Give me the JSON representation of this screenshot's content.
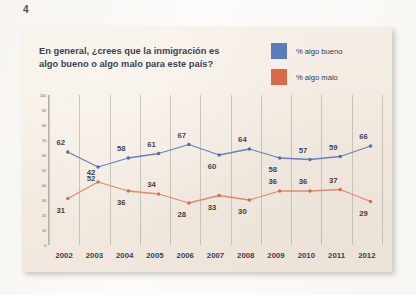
{
  "page": {
    "number": "4"
  },
  "chart_card": {
    "title_line_1": "En general, ¿crees que la inmigración es",
    "title_line_2": "algo bueno o algo malo para este país?"
  },
  "legend": {
    "items": [
      {
        "label": "% algo bueno",
        "color": "#5b7cba",
        "swatch_name": "legend-swatch-algo-bueno"
      },
      {
        "label": "% algo malo",
        "color": "#d96a47",
        "swatch_name": "legend-swatch-algo-malo"
      }
    ]
  },
  "chart_data": {
    "type": "line",
    "title": "En general, ¿crees que la inmigración es algo bueno o algo malo para este país?",
    "xlabel": "",
    "ylabel": "",
    "ylim": [
      0,
      100
    ],
    "ytick_labels": [
      "100",
      "90",
      "80",
      "70",
      "60",
      "50",
      "40",
      "30",
      "20",
      "10",
      "0"
    ],
    "ytick_values": [
      100,
      90,
      80,
      70,
      60,
      50,
      40,
      30,
      20,
      10,
      0
    ],
    "categories": [
      "2002",
      "2003",
      "2004",
      "2005",
      "2006",
      "2007",
      "2008",
      "2009",
      "2010",
      "2011",
      "2012"
    ],
    "grid": "vertical",
    "legend_position": "top-right",
    "series": [
      {
        "name": "% algo bueno",
        "color": "#6981b8",
        "marker_color": "#4f6ba8",
        "values": [
          62,
          52,
          58,
          61,
          67,
          60,
          64,
          58,
          57,
          59,
          66
        ]
      },
      {
        "name": "% algo malo",
        "color": "#e08a6c",
        "marker_color": "#d96a47",
        "values": [
          31,
          42,
          36,
          34,
          28,
          33,
          30,
          36,
          36,
          37,
          29
        ]
      }
    ]
  }
}
